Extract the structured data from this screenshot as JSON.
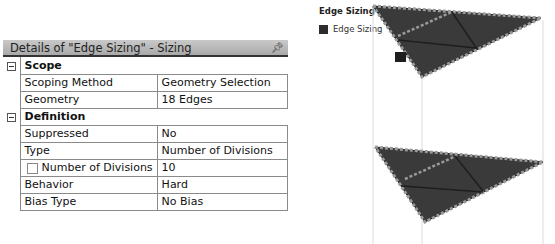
{
  "details": {
    "title": "Details of \"Edge Sizing\" - Sizing",
    "pin_icon": "pin-icon",
    "groups": [
      {
        "label": "Scope",
        "rows": [
          {
            "key": "Scoping Method",
            "value": "Geometry Selection"
          },
          {
            "key": "Geometry",
            "value": "18 Edges"
          }
        ]
      },
      {
        "label": "Definition",
        "rows": [
          {
            "key": "Suppressed",
            "value": "No"
          },
          {
            "key": "Type",
            "value": "Number of Divisions"
          },
          {
            "key": "Number of Divisions",
            "value": "10",
            "checkbox": true
          },
          {
            "key": "Behavior",
            "value": "Hard"
          },
          {
            "key": "Bias Type",
            "value": "No Bias"
          }
        ]
      }
    ]
  },
  "legend": {
    "title": "Edge Sizing",
    "items": [
      {
        "label": "Edge Sizing",
        "color": "#2d2d2d"
      }
    ]
  },
  "colors": {
    "mesh_face": "#3a3a3a",
    "edge_marker": "#8a8a8a",
    "header_bg": "#b5b5b5"
  }
}
